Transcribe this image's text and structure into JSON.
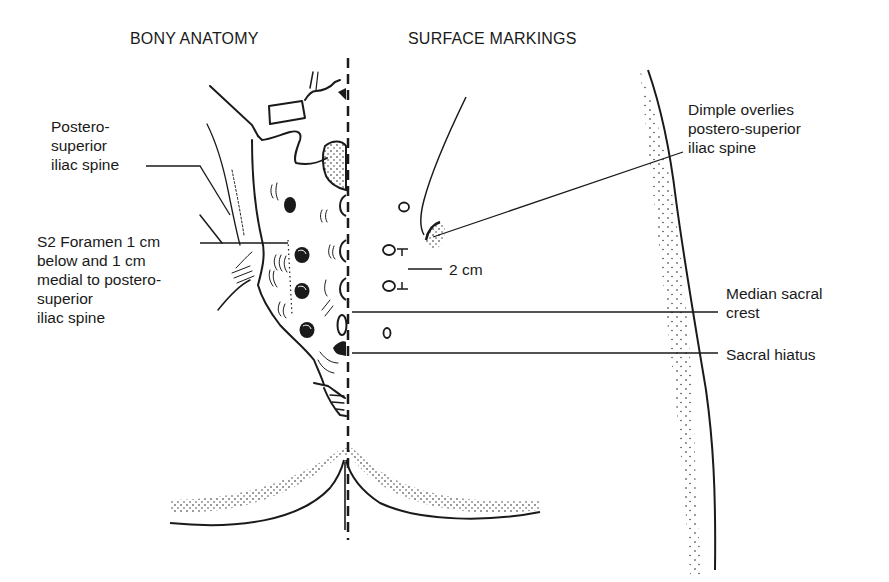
{
  "headings": {
    "left": "BONY ANATOMY",
    "right": "SURFACE MARKINGS"
  },
  "labels": {
    "psis": "Postero-\nsuperior\niliac spine",
    "s2_foramen": "S2 Foramen 1 cm\nbelow and 1 cm\nmedial to postero-\nsuperior\niliac spine",
    "dimple": "Dimple overlies\npostero-superior\niliac spine",
    "two_cm": "2 cm",
    "median_sacral_crest": "Median sacral\ncrest",
    "sacral_hiatus": "Sacral hiatus"
  },
  "colors": {
    "ink": "#1a1a1a",
    "background": "#ffffff"
  }
}
